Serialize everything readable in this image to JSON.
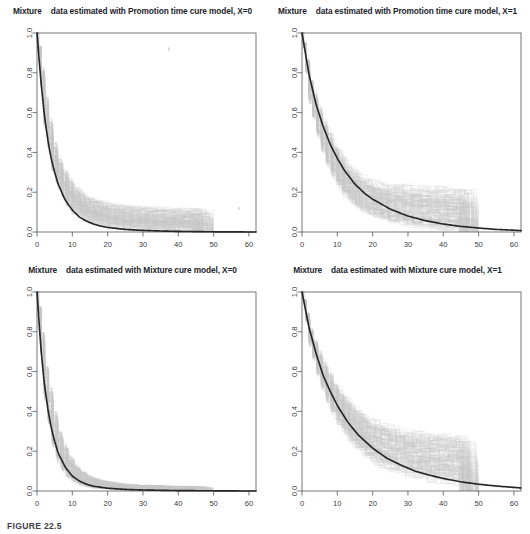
{
  "figure": {
    "caption": "FIGURE 22.5",
    "panel_count": 4
  },
  "axes": {
    "x_ticks": [
      "0",
      "10",
      "20",
      "30",
      "40",
      "50",
      "60"
    ],
    "y_ticks": [
      "0.0",
      "0.2",
      "0.4",
      "0.6",
      "0.8",
      "1.0"
    ]
  },
  "colors": {
    "curve": "#262626",
    "band": "#c6c6c6",
    "band_light": "#d8d8d8",
    "axis": "#555555",
    "text": "#22242a",
    "background": "#ffffff"
  },
  "panels": [
    {
      "id": "promotion-x0",
      "title_word": "Mixture",
      "title_rest": "data estimated with Promotion time cure model, X=0"
    },
    {
      "id": "promotion-x1",
      "title_word": "Mixture",
      "title_rest": "data estimated with Promotion time cure model, X=1"
    },
    {
      "id": "mixture-x0",
      "title_word": "Mixture",
      "title_rest": "data estimated with Mixture cure model, X=0"
    },
    {
      "id": "mixture-x1",
      "title_word": "Mixture",
      "title_rest": "data estimated with Mixture cure model, X=1"
    }
  ],
  "chart_data": [
    {
      "type": "line",
      "id": "promotion-x0",
      "title": "Mixture data estimated with Promotion time cure model, X=0",
      "xlabel": "",
      "ylabel": "",
      "xlim": [
        0,
        62
      ],
      "ylim": [
        0.0,
        1.0
      ],
      "grid": false,
      "legend": "none",
      "xticks": [
        0,
        10,
        20,
        30,
        40,
        50,
        60
      ],
      "yticks": [
        0.0,
        0.2,
        0.4,
        0.6,
        0.8,
        1.0
      ],
      "annotations": [
        "bootstrap replicate step-curves shown in light grey, truncated near t=50"
      ],
      "series": [
        {
          "name": "estimated survival curve",
          "style": "solid-dark",
          "x": [
            0,
            1,
            2,
            3,
            4,
            5,
            6,
            8,
            10,
            12,
            14,
            16,
            18,
            20,
            25,
            30,
            35,
            40,
            45,
            50,
            55,
            60,
            62
          ],
          "values": [
            1.0,
            0.78,
            0.6,
            0.47,
            0.37,
            0.3,
            0.24,
            0.16,
            0.11,
            0.075,
            0.055,
            0.04,
            0.03,
            0.023,
            0.013,
            0.008,
            0.005,
            0.003,
            0.002,
            0.001,
            0.001,
            0.0,
            0.0
          ]
        },
        {
          "name": "bootstrap band upper",
          "style": "grey-band",
          "x": [
            0,
            2,
            4,
            6,
            8,
            10,
            14,
            18,
            22,
            26,
            30,
            36,
            42,
            48,
            50
          ],
          "values": [
            1.0,
            0.68,
            0.46,
            0.34,
            0.27,
            0.22,
            0.17,
            0.145,
            0.13,
            0.122,
            0.117,
            0.112,
            0.11,
            0.108,
            0.0
          ]
        },
        {
          "name": "bootstrap band lower",
          "style": "grey-band",
          "x": [
            0,
            2,
            4,
            6,
            8,
            10,
            14,
            18,
            22,
            26,
            30,
            36,
            42,
            48,
            50
          ],
          "values": [
            1.0,
            0.54,
            0.33,
            0.22,
            0.15,
            0.1,
            0.055,
            0.035,
            0.024,
            0.018,
            0.014,
            0.01,
            0.008,
            0.006,
            0.0
          ]
        }
      ]
    },
    {
      "type": "line",
      "id": "promotion-x1",
      "title": "Mixture data estimated with Promotion time cure model, X=1",
      "xlabel": "",
      "ylabel": "",
      "xlim": [
        0,
        62
      ],
      "ylim": [
        0.0,
        1.0
      ],
      "grid": false,
      "legend": "none",
      "xticks": [
        0,
        10,
        20,
        30,
        40,
        50,
        60
      ],
      "yticks": [
        0.0,
        0.2,
        0.4,
        0.6,
        0.8,
        1.0
      ],
      "annotations": [
        "slower decay than X=0; grey replicates plateau around 0.10-0.28 then drop at t=50"
      ],
      "series": [
        {
          "name": "estimated survival curve",
          "style": "solid-dark",
          "x": [
            0,
            2,
            4,
            6,
            8,
            10,
            12,
            15,
            18,
            20,
            25,
            30,
            35,
            40,
            45,
            50,
            55,
            60,
            62
          ],
          "values": [
            1.0,
            0.79,
            0.64,
            0.53,
            0.44,
            0.37,
            0.31,
            0.24,
            0.19,
            0.165,
            0.115,
            0.08,
            0.057,
            0.04,
            0.028,
            0.02,
            0.013,
            0.009,
            0.007
          ]
        },
        {
          "name": "bootstrap band upper",
          "style": "grey-band",
          "x": [
            0,
            2,
            5,
            8,
            12,
            16,
            20,
            25,
            30,
            36,
            42,
            48,
            50
          ],
          "values": [
            1.0,
            0.76,
            0.58,
            0.45,
            0.33,
            0.27,
            0.24,
            0.225,
            0.215,
            0.208,
            0.203,
            0.2,
            0.0
          ]
        },
        {
          "name": "bootstrap band lower",
          "style": "grey-band",
          "x": [
            0,
            2,
            5,
            8,
            12,
            16,
            20,
            25,
            30,
            36,
            42,
            48,
            50
          ],
          "values": [
            1.0,
            0.66,
            0.44,
            0.3,
            0.18,
            0.12,
            0.085,
            0.055,
            0.04,
            0.028,
            0.021,
            0.017,
            0.0
          ]
        }
      ]
    },
    {
      "type": "line",
      "id": "mixture-x0",
      "title": "Mixture data estimated with Mixture cure model, X=0",
      "xlabel": "",
      "ylabel": "",
      "xlim": [
        0,
        62
      ],
      "ylim": [
        0.0,
        1.0
      ],
      "grid": false,
      "legend": "none",
      "xticks": [
        0,
        10,
        20,
        30,
        40,
        50,
        60
      ],
      "yticks": [
        0.0,
        0.2,
        0.4,
        0.6,
        0.8,
        1.0
      ],
      "annotations": [
        "fastest decay of the four panels; band very tight, reaches near zero by t=20"
      ],
      "series": [
        {
          "name": "estimated survival curve",
          "style": "solid-dark",
          "x": [
            0,
            1,
            2,
            3,
            4,
            5,
            6,
            8,
            10,
            12,
            14,
            16,
            20,
            25,
            30,
            40,
            50,
            60,
            62
          ],
          "values": [
            1.0,
            0.74,
            0.55,
            0.42,
            0.32,
            0.25,
            0.19,
            0.12,
            0.075,
            0.05,
            0.034,
            0.024,
            0.014,
            0.008,
            0.005,
            0.002,
            0.001,
            0.0,
            0.0
          ]
        },
        {
          "name": "bootstrap band upper",
          "style": "grey-band",
          "x": [
            0,
            2,
            4,
            6,
            8,
            11,
            14,
            18,
            24,
            30,
            38,
            46,
            50
          ],
          "values": [
            1.0,
            0.63,
            0.41,
            0.27,
            0.18,
            0.105,
            0.07,
            0.048,
            0.033,
            0.027,
            0.023,
            0.021,
            0.0
          ]
        },
        {
          "name": "bootstrap band lower",
          "style": "grey-band",
          "x": [
            0,
            2,
            4,
            6,
            8,
            11,
            14,
            18,
            24,
            30,
            38,
            46,
            50
          ],
          "values": [
            1.0,
            0.48,
            0.26,
            0.14,
            0.08,
            0.04,
            0.022,
            0.013,
            0.007,
            0.005,
            0.003,
            0.002,
            0.0
          ]
        }
      ]
    },
    {
      "type": "line",
      "id": "mixture-x1",
      "title": "Mixture data estimated with Mixture cure model, X=1",
      "xlabel": "",
      "ylabel": "",
      "xlim": [
        0,
        62
      ],
      "ylim": [
        0.0,
        1.0
      ],
      "grid": false,
      "legend": "none",
      "xticks": [
        0,
        10,
        20,
        30,
        40,
        50,
        60
      ],
      "yticks": [
        0.0,
        0.2,
        0.4,
        0.6,
        0.8,
        1.0
      ],
      "annotations": [
        "slowest decay; widest grey bootstrap envelope, replicates plateau 0.10-0.30 and truncate at t=50"
      ],
      "series": [
        {
          "name": "estimated survival curve",
          "style": "solid-dark",
          "x": [
            0,
            2,
            4,
            6,
            8,
            10,
            13,
            16,
            20,
            24,
            28,
            32,
            36,
            40,
            45,
            50,
            55,
            60,
            62
          ],
          "values": [
            1.0,
            0.82,
            0.69,
            0.58,
            0.5,
            0.43,
            0.345,
            0.28,
            0.215,
            0.165,
            0.13,
            0.1,
            0.08,
            0.063,
            0.046,
            0.034,
            0.025,
            0.018,
            0.015
          ]
        },
        {
          "name": "bootstrap band upper",
          "style": "grey-band",
          "x": [
            0,
            2,
            5,
            9,
            13,
            18,
            23,
            28,
            34,
            40,
            46,
            50
          ],
          "values": [
            1.0,
            0.81,
            0.66,
            0.52,
            0.43,
            0.355,
            0.315,
            0.292,
            0.277,
            0.268,
            0.262,
            0.0
          ]
        },
        {
          "name": "bootstrap band lower",
          "style": "grey-band",
          "x": [
            0,
            2,
            5,
            9,
            13,
            18,
            23,
            28,
            34,
            40,
            46,
            50
          ],
          "values": [
            1.0,
            0.74,
            0.54,
            0.37,
            0.26,
            0.175,
            0.125,
            0.095,
            0.07,
            0.055,
            0.045,
            0.0
          ]
        }
      ]
    }
  ]
}
